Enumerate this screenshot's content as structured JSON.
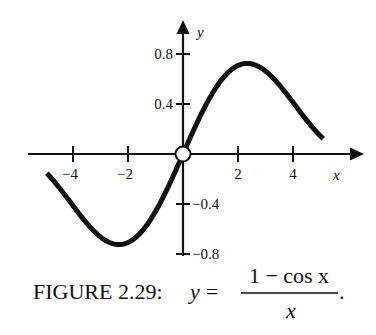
{
  "chart_data": {
    "type": "line",
    "title": "",
    "function": "y = (1 - cos x) / x",
    "xlabel": "x",
    "ylabel": "y",
    "xlim": [
      -5.0,
      5.1
    ],
    "ylim": [
      -0.8,
      0.8
    ],
    "x_ticks": [
      -4,
      -2,
      2,
      4
    ],
    "x_tick_labels": [
      "−4",
      "−2",
      "2",
      "4"
    ],
    "y_ticks": [
      0.8,
      0.4,
      -0.4,
      -0.8
    ],
    "y_tick_labels": [
      "0.8",
      "0.4",
      "−0.4",
      "−0.8"
    ],
    "grid": false,
    "legend": null,
    "series": [
      {
        "name": "(1 - cos x)/x",
        "x": [
          -4.95,
          -4,
          -3,
          -2.33,
          -2,
          -1,
          -0.5,
          0.5,
          1,
          2,
          2.33,
          3,
          4,
          5.1
        ],
        "y": [
          -0.15,
          -0.41,
          -0.66,
          -0.725,
          -0.71,
          -0.46,
          -0.245,
          0.245,
          0.46,
          0.71,
          0.725,
          0.66,
          0.41,
          0.12
        ]
      }
    ],
    "annotations": [
      {
        "type": "open-circle",
        "x": 0,
        "y": 0,
        "meaning": "removable discontinuity at origin"
      }
    ]
  },
  "caption": {
    "prefix": "FIGURE 2.29:",
    "lhs": "y",
    "equals": "=",
    "numerator": "1 − cos x",
    "denominator": "x",
    "suffix": "."
  }
}
